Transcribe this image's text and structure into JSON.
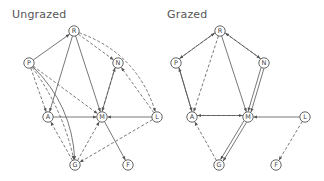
{
  "diagram": {
    "panels": [
      {
        "id": "ungrazed",
        "title": "Ungrazed",
        "nodes": [
          {
            "id": "R",
            "label": "R",
            "x": 74,
            "y": 31
          },
          {
            "id": "P",
            "label": "P",
            "x": 29,
            "y": 63
          },
          {
            "id": "N",
            "label": "N",
            "x": 118,
            "y": 63
          },
          {
            "id": "A",
            "label": "A",
            "x": 48,
            "y": 117
          },
          {
            "id": "M",
            "label": "M",
            "x": 102,
            "y": 117
          },
          {
            "id": "L",
            "label": "L",
            "x": 157,
            "y": 117
          },
          {
            "id": "G",
            "label": "G",
            "x": 75,
            "y": 165
          },
          {
            "id": "F",
            "label": "F",
            "x": 128,
            "y": 165
          }
        ],
        "edges": [
          {
            "from": "P",
            "to": "R",
            "style": "solid"
          },
          {
            "from": "R",
            "to": "A",
            "style": "solid"
          },
          {
            "from": "R",
            "to": "M",
            "style": "solid"
          },
          {
            "from": "R",
            "to": "N",
            "style": "dashed"
          },
          {
            "from": "R",
            "to": "L",
            "style": "dashed",
            "curve": 30
          },
          {
            "from": "P",
            "to": "A",
            "style": "dashed"
          },
          {
            "from": "P",
            "to": "M",
            "style": "dashed"
          },
          {
            "from": "P",
            "to": "G",
            "style": "solid",
            "curve": 22
          },
          {
            "from": "P",
            "to": "G",
            "style": "dashed",
            "curve": 12
          },
          {
            "from": "A",
            "to": "M",
            "style": "solid"
          },
          {
            "from": "G",
            "to": "A",
            "style": "dashed"
          },
          {
            "from": "G",
            "to": "M",
            "style": "dashed"
          },
          {
            "from": "M",
            "to": "N",
            "style": "solid",
            "offset": -1.5
          },
          {
            "from": "N",
            "to": "M",
            "style": "dashed",
            "offset": 1.5
          },
          {
            "from": "L",
            "to": "N",
            "style": "dashed"
          },
          {
            "from": "L",
            "to": "M",
            "style": "solid"
          },
          {
            "from": "L",
            "to": "G",
            "style": "dashed"
          },
          {
            "from": "M",
            "to": "F",
            "style": "solid"
          }
        ]
      },
      {
        "id": "grazed",
        "title": "Grazed",
        "nodes": [
          {
            "id": "R",
            "label": "R",
            "x": 220,
            "y": 31
          },
          {
            "id": "P",
            "label": "P",
            "x": 176,
            "y": 63
          },
          {
            "id": "N",
            "label": "N",
            "x": 264,
            "y": 63
          },
          {
            "id": "A",
            "label": "A",
            "x": 192,
            "y": 117
          },
          {
            "id": "M",
            "label": "M",
            "x": 248,
            "y": 117
          },
          {
            "id": "L",
            "label": "L",
            "x": 305,
            "y": 117
          },
          {
            "id": "G",
            "label": "G",
            "x": 219,
            "y": 165
          },
          {
            "id": "F",
            "label": "F",
            "x": 276,
            "y": 165
          }
        ],
        "edges": [
          {
            "from": "P",
            "to": "R",
            "style": "solid",
            "offset": -1.5
          },
          {
            "from": "R",
            "to": "P",
            "style": "dashed",
            "offset": 1.5
          },
          {
            "from": "R",
            "to": "N",
            "style": "solid",
            "offset": -1.5
          },
          {
            "from": "N",
            "to": "R",
            "style": "dashed",
            "offset": 1.5
          },
          {
            "from": "R",
            "to": "A",
            "style": "dashed"
          },
          {
            "from": "R",
            "to": "M",
            "style": "solid"
          },
          {
            "from": "P",
            "to": "A",
            "style": "solid",
            "offset": -1.5
          },
          {
            "from": "A",
            "to": "P",
            "style": "solid",
            "offset": 1.5
          },
          {
            "from": "N",
            "to": "M",
            "style": "solid",
            "offset": -1.5
          },
          {
            "from": "N",
            "to": "M",
            "style": "solid",
            "offset": 1.5
          },
          {
            "from": "M",
            "to": "A",
            "style": "solid",
            "offset": 1.5
          },
          {
            "from": "A",
            "to": "M",
            "style": "dashed",
            "offset": -1.5
          },
          {
            "from": "L",
            "to": "M",
            "style": "solid"
          },
          {
            "from": "G",
            "to": "A",
            "style": "dashed"
          },
          {
            "from": "M",
            "to": "G",
            "style": "solid",
            "offset": -1.5
          },
          {
            "from": "M",
            "to": "G",
            "style": "solid",
            "offset": 1.5
          },
          {
            "from": "L",
            "to": "F",
            "style": "dashed"
          }
        ]
      }
    ],
    "legend": {
      "solid": "solid arrow",
      "dashed": "dashed arrow"
    },
    "colors": {
      "stroke": "#555555",
      "text": "#444444",
      "background": "#ffffff"
    }
  }
}
